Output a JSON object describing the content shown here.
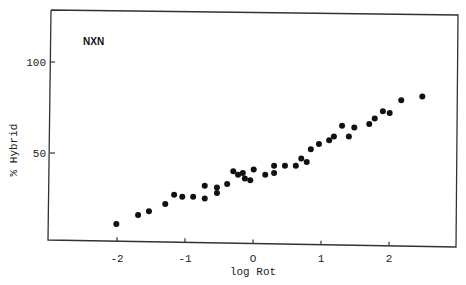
{
  "chart_data": {
    "type": "scatter",
    "title": "",
    "annotation": "NXN",
    "xlabel": "log Rot",
    "ylabel": "% Hybrid",
    "xlim": [
      -3.0,
      3.0
    ],
    "ylim": [
      0,
      127
    ],
    "x_ticks": [
      -2,
      -1,
      0,
      1,
      2
    ],
    "x_tick_labels": [
      "-2",
      "-1",
      "O",
      "1",
      "2"
    ],
    "y_ticks": [
      50,
      100
    ],
    "y_tick_labels": [
      "50",
      "100"
    ],
    "grid": false,
    "legend": null,
    "marker_color": "#111111",
    "axis_color": "#333333",
    "points": [
      {
        "x": -2.01,
        "y": 11
      },
      {
        "x": -1.69,
        "y": 16
      },
      {
        "x": -1.53,
        "y": 18
      },
      {
        "x": -1.29,
        "y": 22
      },
      {
        "x": -1.16,
        "y": 27
      },
      {
        "x": -1.04,
        "y": 26
      },
      {
        "x": -0.88,
        "y": 26
      },
      {
        "x": -0.71,
        "y": 32
      },
      {
        "x": -0.71,
        "y": 25
      },
      {
        "x": -0.53,
        "y": 31
      },
      {
        "x": -0.53,
        "y": 28
      },
      {
        "x": -0.38,
        "y": 33
      },
      {
        "x": -0.29,
        "y": 40
      },
      {
        "x": -0.22,
        "y": 38
      },
      {
        "x": -0.15,
        "y": 39
      },
      {
        "x": -0.12,
        "y": 36
      },
      {
        "x": -0.04,
        "y": 35
      },
      {
        "x": 0.01,
        "y": 41
      },
      {
        "x": 0.18,
        "y": 38
      },
      {
        "x": 0.31,
        "y": 43
      },
      {
        "x": 0.31,
        "y": 39
      },
      {
        "x": 0.47,
        "y": 43
      },
      {
        "x": 0.63,
        "y": 43
      },
      {
        "x": 0.71,
        "y": 47
      },
      {
        "x": 0.79,
        "y": 45
      },
      {
        "x": 0.85,
        "y": 52
      },
      {
        "x": 0.97,
        "y": 55
      },
      {
        "x": 1.12,
        "y": 57
      },
      {
        "x": 1.19,
        "y": 59
      },
      {
        "x": 1.31,
        "y": 65
      },
      {
        "x": 1.41,
        "y": 59
      },
      {
        "x": 1.49,
        "y": 64
      },
      {
        "x": 1.71,
        "y": 66
      },
      {
        "x": 1.79,
        "y": 69
      },
      {
        "x": 1.91,
        "y": 73
      },
      {
        "x": 2.01,
        "y": 72
      },
      {
        "x": 2.18,
        "y": 79
      },
      {
        "x": 2.49,
        "y": 81
      }
    ]
  }
}
